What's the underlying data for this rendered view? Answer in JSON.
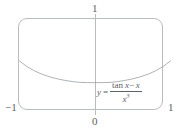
{
  "figure": {
    "name": "function-plot",
    "frame": {
      "rounded": true,
      "border_color": "#b9bdc2"
    },
    "axis": {
      "vertical_line_color": "#b9bdc2",
      "labels": {
        "y_top": "1",
        "origin": "0",
        "x_min": "−1",
        "x_max": "1"
      }
    },
    "equation": {
      "lhs": "y",
      "equals": "=",
      "numerator_fn": "tan",
      "numerator_var": "x",
      "numerator_minus": "−",
      "numerator_term": "x",
      "denominator_var": "x",
      "denominator_exponent": "3",
      "plain": "y = (tan x − x) / x³"
    },
    "curve": {
      "color": "#9a9ea3",
      "width": 0.8
    }
  },
  "chart_data": {
    "type": "line",
    "title": "",
    "subtitle": "",
    "xlabel": "",
    "ylabel": "",
    "xlim": [
      -1,
      1
    ],
    "ylim": [
      0,
      1
    ],
    "grid": false,
    "legend": null,
    "annotations": [
      {
        "text": "y = (tan x − x) / x³",
        "x": 0.05,
        "y": 0.18
      }
    ],
    "xticks": [
      -1,
      0,
      1
    ],
    "xticklabels": [
      "−1",
      "0",
      "1"
    ],
    "yticks": [
      1
    ],
    "yticklabels": [
      "1"
    ],
    "series": [
      {
        "name": "y = (tan x - x)/x^3",
        "x": [
          -1.0,
          -0.9,
          -0.8,
          -0.7,
          -0.6,
          -0.5,
          -0.4,
          -0.3,
          -0.2,
          -0.1,
          0.0,
          0.1,
          0.2,
          0.3,
          0.4,
          0.5,
          0.6,
          0.7,
          0.8,
          0.9,
          1.0
        ],
        "y": [
          0.5574,
          0.4985,
          0.4541,
          0.42,
          0.3936,
          0.373,
          0.357,
          0.3447,
          0.336,
          0.334,
          0.3333,
          0.334,
          0.336,
          0.3447,
          0.357,
          0.373,
          0.3936,
          0.42,
          0.4541,
          0.4985,
          0.5574
        ]
      }
    ]
  }
}
